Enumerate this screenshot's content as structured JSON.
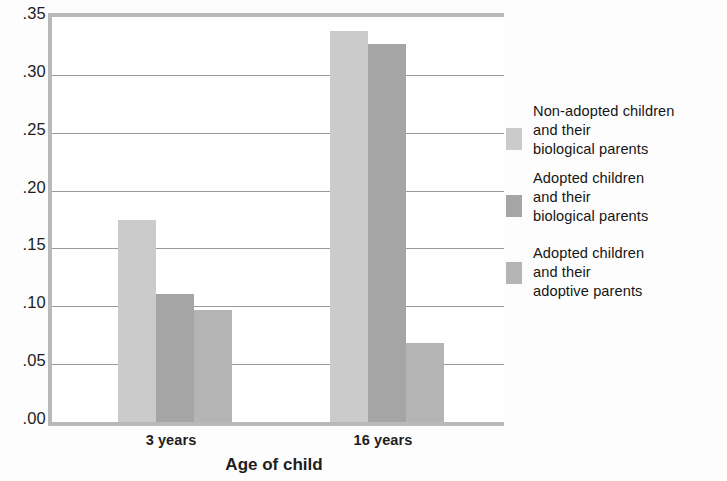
{
  "chart_data": {
    "type": "bar",
    "title": "",
    "xlabel": "Age of child",
    "ylabel": "",
    "categories": [
      "3 years",
      "16 years"
    ],
    "ylim": [
      0.0,
      0.35
    ],
    "yticks": [
      ".00",
      ".05",
      ".10",
      ".15",
      ".20",
      ".25",
      ".30",
      ".35"
    ],
    "ytick_values": [
      0.0,
      0.05,
      0.1,
      0.15,
      0.2,
      0.25,
      0.3,
      0.35
    ],
    "grid": "horizontal",
    "legend_position": "right",
    "series": [
      {
        "name": "Non-adopted children and their biological parents",
        "name_lines": [
          "Non-adopted children",
          "and their",
          "biological parents"
        ],
        "color": "#cbcbcb",
        "values": [
          0.175,
          0.338
        ]
      },
      {
        "name": "Adopted children and their biological parents",
        "name_lines": [
          "Adopted children",
          "and their",
          "biological parents"
        ],
        "color": "#a5a5a5",
        "values": [
          0.111,
          0.327
        ]
      },
      {
        "name": "Adopted children and their adoptive parents",
        "name_lines": [
          "Adopted children",
          "and  their",
          "adoptive parents"
        ],
        "color": "#b4b4b4",
        "values": [
          0.097,
          0.068
        ]
      }
    ]
  },
  "axis": {
    "x_title": "Age of child",
    "x_labels": [
      "3 years",
      "16 years"
    ],
    "y_labels": [
      ".35",
      ".30",
      ".25",
      ".20",
      ".15",
      ".10",
      ".05",
      ".00"
    ]
  },
  "legend": {
    "entries": [
      {
        "swatch_color": "#cbcbcb",
        "lines": [
          "Non-adopted children",
          "and their",
          "biological parents"
        ]
      },
      {
        "swatch_color": "#a5a5a5",
        "lines": [
          "Adopted children",
          "and their",
          "biological parents"
        ]
      },
      {
        "swatch_color": "#b4b4b4",
        "lines": [
          "Adopted children",
          "and  their",
          "adoptive parents"
        ]
      }
    ]
  },
  "style": {
    "axis_color": "#b9b9b9",
    "grid_color": "#9a9a9a",
    "background": "#fdfdfd",
    "text_color": "#1d1d1d"
  }
}
